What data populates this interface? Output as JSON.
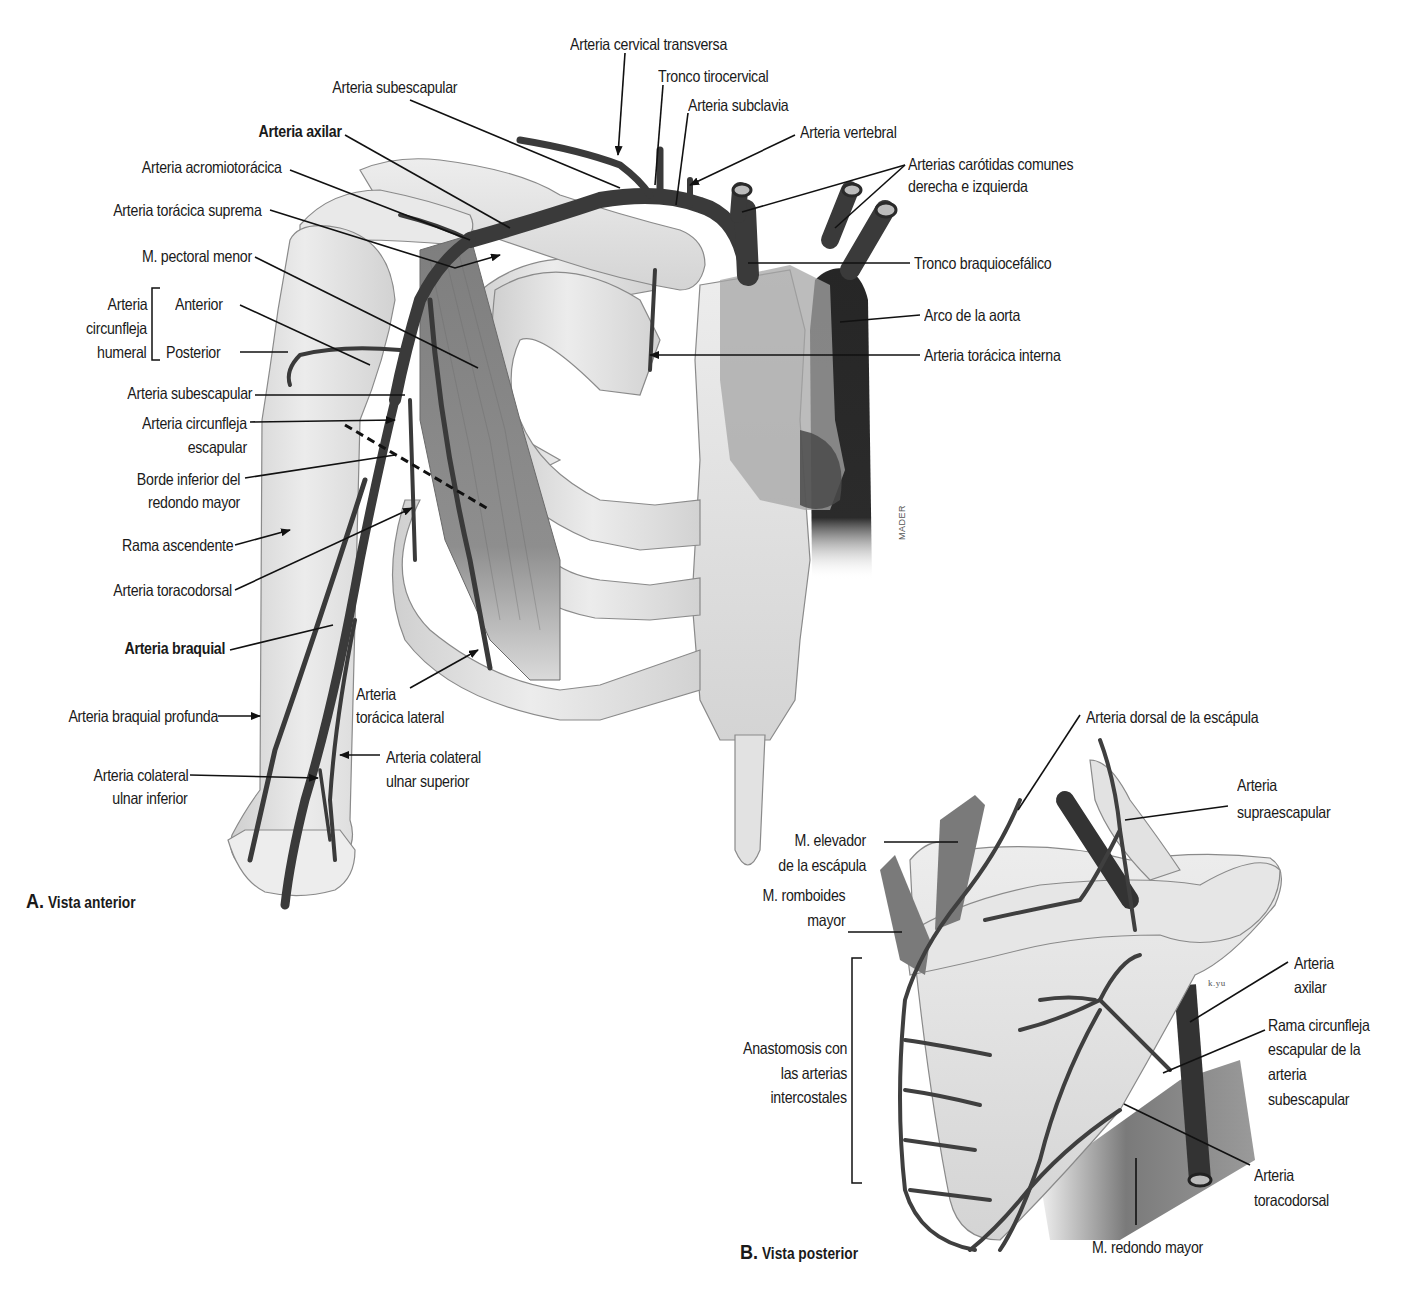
{
  "figure": {
    "panels": [
      {
        "id": "A",
        "letter": "A.",
        "title": "Vista anterior"
      },
      {
        "id": "B",
        "letter": "B.",
        "title": "Vista posterior"
      }
    ],
    "signatures": {
      "panel_a": "MADER",
      "panel_b": "k.yu"
    }
  },
  "panel_a_labels": {
    "cervical_transversa": "Arteria cervical transversa",
    "tronco_tirocervical": "Tronco tirocervical",
    "subclavia": "Arteria subclavia",
    "vertebral": "Arteria vertebral",
    "carotidas_1": "Arterias carótidas comunes",
    "carotidas_2": "derecha e izquierda",
    "tronco_braquiocefalico": "Tronco braquiocefálico",
    "arco_aorta": "Arco de la aorta",
    "toracica_interna": "Arteria torácica interna",
    "subescapular_top": "Arteria subescapular",
    "axilar": "Arteria axilar",
    "acromiotoracica": "Arteria acromiotorácica",
    "toracica_suprema": "Arteria torácica suprema",
    "pectoral_menor": "M. pectoral menor",
    "circunfleja_humeral_1": "Arteria",
    "circunfleja_humeral_2": "circunfleja",
    "circunfleja_humeral_3": "humeral",
    "anterior": "Anterior",
    "posterior": "Posterior",
    "subescapular": "Arteria subescapular",
    "circunfleja_escapular_1": "Arteria circunfleja",
    "circunfleja_escapular_2": "escapular",
    "borde_inferior_1": "Borde inferior del",
    "borde_inferior_2": "redondo mayor",
    "rama_ascendente": "Rama ascendente",
    "toracodorsal": "Arteria toracodorsal",
    "braquial": "Arteria braquial",
    "toracica_lateral_1": "Arteria",
    "toracica_lateral_2": "torácica lateral",
    "braquial_profunda": "Arteria braquial profunda",
    "colateral_ulnar_sup_1": "Arteria colateral",
    "colateral_ulnar_sup_2": "ulnar superior",
    "colateral_ulnar_inf_1": "Arteria colateral",
    "colateral_ulnar_inf_2": "ulnar inferior"
  },
  "panel_b_labels": {
    "dorsal_escapula": "Arteria dorsal de la escápula",
    "supraescapular_1": "Arteria",
    "supraescapular_2": "supraescapular",
    "elevador_1": "M. elevador",
    "elevador_2": "de la escápula",
    "romboides_1": "M. romboides",
    "romboides_2": "mayor",
    "axilar_1": "Arteria",
    "axilar_2": "axilar",
    "rama_circunfleja_1": "Rama circunfleja",
    "rama_circunfleja_2": "escapular de la",
    "rama_circunfleja_3": "arteria",
    "rama_circunfleja_4": "subescapular",
    "anastomosis_1": "Anastomosis con",
    "anastomosis_2": "las arterias",
    "anastomosis_3": "intercostales",
    "toracodorsal_1": "Arteria",
    "toracodorsal_2": "toracodorsal",
    "redondo_mayor": "M. redondo mayor"
  },
  "colors": {
    "artery": "#3a3a3a",
    "artery_dark": "#1e1e1e",
    "bone": "#e4e4e4",
    "bone_edge": "#8a8a8a",
    "muscle": "#8c8c8c",
    "heart_light": "#a8a8a8",
    "leader": "#111111"
  }
}
